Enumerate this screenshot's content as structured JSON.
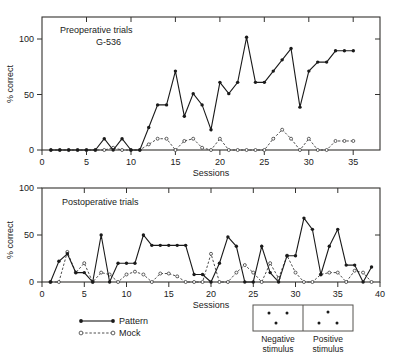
{
  "figure": {
    "title": "",
    "background": "#ffffff",
    "ink_color": "#1a1a1a"
  },
  "legend": {
    "entries": [
      {
        "key": "pattern",
        "label": "Pattern",
        "line": "solid",
        "marker": "filled-circle"
      },
      {
        "key": "mock",
        "label": "Mock",
        "line": "dashed",
        "marker": "open-circle"
      }
    ]
  },
  "stimulus_key": {
    "negative": {
      "label_line1": "Negative",
      "label_line2": "stimulus",
      "dots": [
        [
          0.32,
          0.3
        ],
        [
          0.68,
          0.3
        ],
        [
          0.46,
          0.7
        ]
      ]
    },
    "positive": {
      "label_line1": "Positive",
      "label_line2": "stimulus",
      "dots": [
        [
          0.5,
          0.28
        ],
        [
          0.33,
          0.7
        ],
        [
          0.68,
          0.7
        ]
      ]
    }
  },
  "chart_data": [
    {
      "id": "preoperative",
      "type": "line",
      "title": "Preoperative trials",
      "subtitle": "G-536",
      "xlabel": "Sessions",
      "ylabel": "% correct",
      "xlim": [
        0,
        38
      ],
      "ylim": [
        0,
        118
      ],
      "xticks": [
        0,
        5,
        10,
        15,
        20,
        25,
        30,
        35
      ],
      "xticklabels": [
        "0",
        "5",
        "10",
        "15",
        "20",
        "25",
        "30",
        "35"
      ],
      "xminorticks": [
        1,
        2,
        3,
        4,
        6,
        7,
        8,
        9,
        11,
        12,
        13,
        14,
        16,
        17,
        18,
        19,
        21,
        22,
        23,
        24,
        26,
        27,
        28,
        29,
        31,
        32,
        33,
        34,
        36,
        37,
        38
      ],
      "yticks": [
        0,
        50,
        100
      ],
      "yticklabels": [
        "0",
        "50",
        "100"
      ],
      "grid": false,
      "frame": "box",
      "legend_position": "below-figure",
      "series": [
        {
          "name": "Pattern",
          "marker": "filled-circle",
          "line": "solid",
          "x": [
            1,
            2,
            3,
            4,
            5,
            6,
            7,
            8,
            9,
            10,
            11,
            12,
            13,
            14,
            15,
            16,
            17,
            18,
            19,
            20,
            21,
            22,
            23,
            24,
            25,
            26,
            27,
            28,
            29,
            30,
            31,
            32,
            33,
            34,
            35
          ],
          "values": [
            0,
            0,
            0,
            0,
            0,
            0,
            10,
            0,
            10,
            0,
            0,
            20,
            40,
            40,
            70,
            30,
            50,
            40,
            18,
            60,
            50,
            60,
            100,
            60,
            60,
            70,
            80,
            90,
            38,
            70,
            78,
            78,
            88,
            88,
            88
          ]
        },
        {
          "name": "Mock",
          "marker": "open-circle",
          "line": "dashed",
          "x": [
            1,
            2,
            3,
            4,
            5,
            6,
            7,
            8,
            9,
            10,
            11,
            12,
            13,
            14,
            15,
            16,
            17,
            18,
            19,
            20,
            21,
            22,
            23,
            24,
            25,
            26,
            27,
            28,
            29,
            30,
            31,
            32,
            33,
            34,
            35
          ],
          "values": [
            0,
            0,
            0,
            0,
            0,
            0,
            0,
            2,
            0,
            0,
            0,
            5,
            10,
            10,
            0,
            8,
            10,
            2,
            0,
            10,
            0,
            0,
            0,
            0,
            0,
            10,
            18,
            10,
            0,
            10,
            0,
            0,
            8,
            8,
            8
          ]
        }
      ]
    },
    {
      "id": "postoperative",
      "type": "line",
      "title": "Postoperative trials",
      "subtitle": "",
      "xlabel": "Sessions",
      "ylabel": "% correct",
      "xlim": [
        0,
        40
      ],
      "ylim": [
        0,
        100
      ],
      "xticks": [
        0,
        5,
        10,
        15,
        20,
        25,
        30,
        35,
        40
      ],
      "xticklabels": [
        "0",
        "5",
        "10",
        "15",
        "20",
        "25",
        "30",
        "35",
        "40"
      ],
      "xminorticks": [
        1,
        2,
        3,
        4,
        6,
        7,
        8,
        9,
        11,
        12,
        13,
        14,
        16,
        17,
        18,
        19,
        21,
        22,
        23,
        24,
        26,
        27,
        28,
        29,
        31,
        32,
        33,
        34,
        36,
        37,
        38,
        39
      ],
      "yticks": [
        0,
        50,
        100
      ],
      "yticklabels": [
        "0",
        "50",
        "100"
      ],
      "grid": false,
      "frame": "box",
      "legend_position": "below-figure",
      "series": [
        {
          "name": "Pattern",
          "marker": "filled-circle",
          "line": "solid",
          "x": [
            1,
            2,
            3,
            4,
            5,
            6,
            7,
            8,
            9,
            10,
            11,
            12,
            13,
            14,
            15,
            16,
            17,
            18,
            19,
            20,
            21,
            22,
            23,
            24,
            25,
            26,
            27,
            28,
            29,
            30,
            31,
            32,
            33,
            34,
            35,
            36,
            37,
            38,
            39
          ],
          "values": [
            0,
            22,
            30,
            10,
            10,
            0,
            50,
            0,
            20,
            20,
            20,
            50,
            39,
            39,
            39,
            39,
            39,
            8,
            8,
            0,
            20,
            48,
            38,
            0,
            0,
            38,
            10,
            0,
            28,
            28,
            68,
            56,
            8,
            38,
            56,
            18,
            18,
            0,
            16
          ]
        },
        {
          "name": "Mock",
          "marker": "open-circle",
          "line": "dashed",
          "x": [
            1,
            2,
            3,
            4,
            5,
            6,
            7,
            8,
            9,
            10,
            11,
            12,
            13,
            14,
            15,
            16,
            17,
            18,
            19,
            20,
            21,
            22,
            23,
            24,
            25,
            26,
            27,
            28,
            29,
            30,
            31,
            32,
            33,
            34,
            35,
            36,
            37,
            38,
            39
          ],
          "values": [
            0,
            0,
            32,
            10,
            20,
            0,
            10,
            8,
            0,
            8,
            11,
            8,
            0,
            9,
            9,
            6,
            0,
            0,
            0,
            30,
            0,
            0,
            10,
            18,
            10,
            0,
            20,
            4,
            28,
            10,
            0,
            0,
            8,
            10,
            10,
            0,
            12,
            10,
            0
          ]
        }
      ]
    }
  ]
}
